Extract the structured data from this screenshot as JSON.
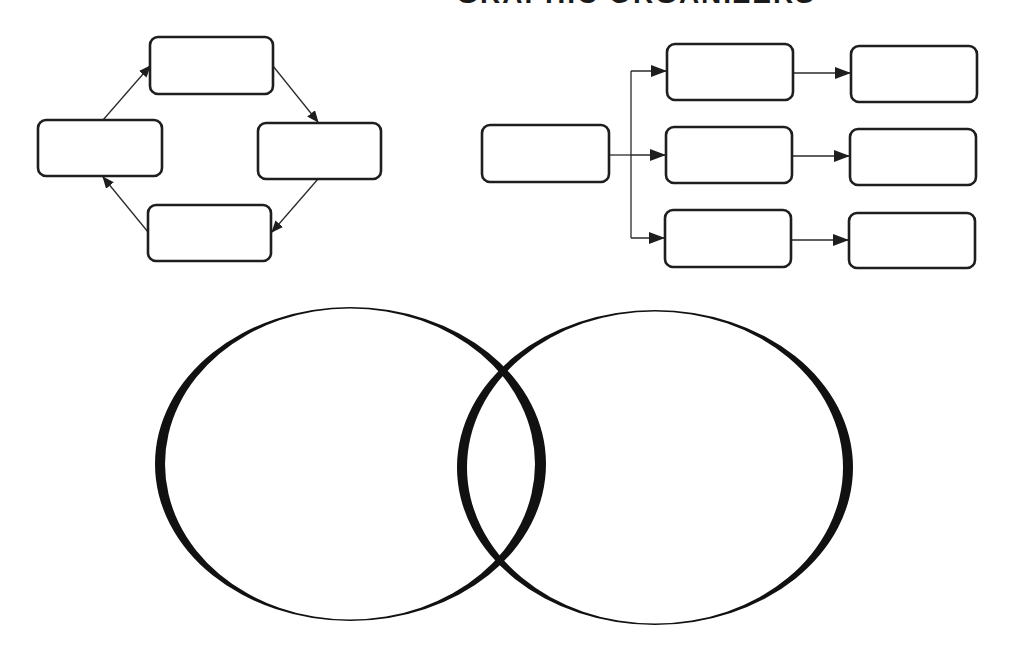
{
  "page": {
    "title_partial": "GRAPHIC ORGANIZERS",
    "background": "#ffffff",
    "stroke_color": "#1e1e1e"
  },
  "cycle_diagram": {
    "type": "cycle",
    "boxes": [
      {
        "id": "top",
        "label": "",
        "x": 150,
        "y": 37,
        "w": 123,
        "h": 57
      },
      {
        "id": "right",
        "label": "",
        "x": 258,
        "y": 123,
        "w": 123,
        "h": 56
      },
      {
        "id": "bottom",
        "label": "",
        "x": 148,
        "y": 205,
        "w": 123,
        "h": 56
      },
      {
        "id": "left",
        "label": "",
        "x": 38,
        "y": 120,
        "w": 124,
        "h": 56
      }
    ],
    "arrows": [
      {
        "from": "left",
        "to": "top"
      },
      {
        "from": "top",
        "to": "right"
      },
      {
        "from": "right",
        "to": "bottom"
      },
      {
        "from": "bottom",
        "to": "left"
      }
    ]
  },
  "tree_diagram": {
    "type": "branching-flow",
    "root": {
      "id": "root",
      "label": "",
      "x": 482,
      "y": 125,
      "w": 127,
      "h": 57
    },
    "branches": [
      {
        "level1": {
          "label": "",
          "x": 667,
          "y": 44,
          "w": 126,
          "h": 56
        },
        "level2": {
          "label": "",
          "x": 851,
          "y": 46,
          "w": 126,
          "h": 56
        }
      },
      {
        "level1": {
          "label": "",
          "x": 666,
          "y": 127,
          "w": 126,
          "h": 56
        },
        "level2": {
          "label": "",
          "x": 850,
          "y": 129,
          "w": 126,
          "h": 56
        }
      },
      {
        "level1": {
          "label": "",
          "x": 665,
          "y": 210,
          "w": 126,
          "h": 57
        },
        "level2": {
          "label": "",
          "x": 849,
          "y": 213,
          "w": 126,
          "h": 55
        }
      }
    ]
  },
  "venn_diagram": {
    "type": "venn",
    "sets": [
      {
        "id": "set-a",
        "label": ""
      },
      {
        "id": "set-b",
        "label": ""
      }
    ],
    "overlap_label": ""
  }
}
